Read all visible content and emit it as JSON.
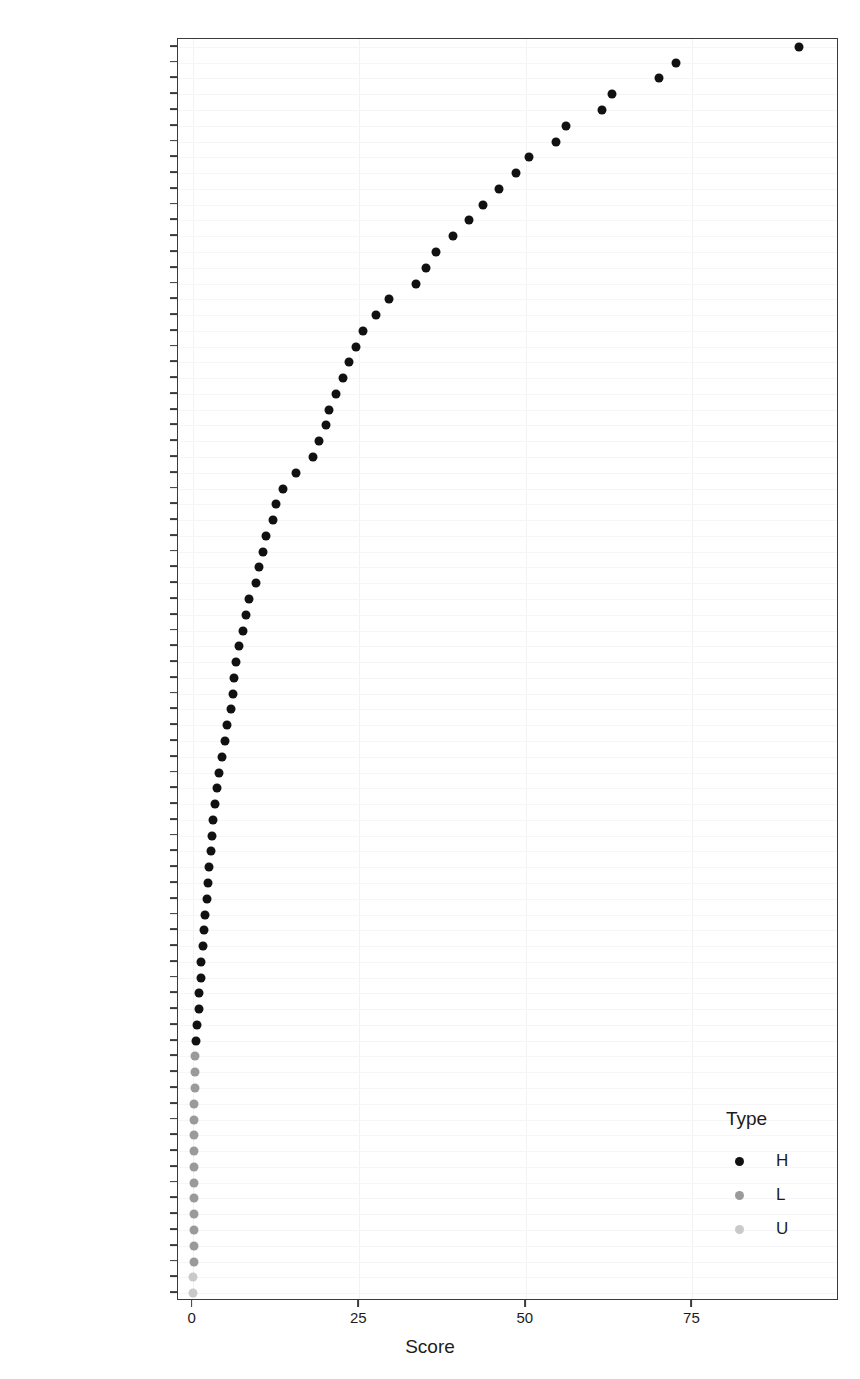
{
  "top_strip_text": "",
  "legend": {
    "title": "Type",
    "entries": [
      {
        "label": "H",
        "color": "#111111"
      },
      {
        "label": "L",
        "color": "#9a9a9a"
      },
      {
        "label": "U",
        "color": "#c9c9c9"
      }
    ]
  },
  "chart_data": {
    "type": "scatter",
    "title": "",
    "xlabel": "Score",
    "ylabel": "",
    "xlim": [
      -2.2,
      97.0
    ],
    "xticks": [
      0,
      25,
      50,
      75
    ],
    "xtick_labels": [
      "0",
      "25",
      "50",
      "75"
    ],
    "grid": true,
    "legend_position": "right-bottom",
    "legend_title": "Type",
    "groups": [
      "H",
      "L",
      "U"
    ],
    "group_colors": {
      "H": "#111111",
      "L": "#9a9a9a",
      "U": "#c9c9c9"
    },
    "categories": [
      "Overall_Qual",
      "Neighborhood",
      "Gr_Liv_Area",
      "Full_Bath",
      "Year_Built",
      "Exter_Qual",
      "Garage_Cars",
      "Kitchen_Qual",
      "Foundation",
      "Bsmt_Qual",
      "Garage_Finish",
      "MS_SubClass",
      "Garage_Area",
      "Year_Remod_Add",
      "Garage_Type",
      "Total_Bsmt_SF",
      "Fireplace_Qu",
      "Fireplaces",
      "BsmtFin_Type_1",
      "First_Flr_SF",
      "Open_Porch_SF",
      "Heating_QC",
      "Longitude",
      "Latitude",
      "TotRms_AbvGrd",
      "Exterior_1st",
      "Exterior_2nd",
      "Lot_Area",
      "Mas_Vnr_Type",
      "Mas_Vnr_Area",
      "MS_Zoning",
      "Overall_Cond",
      "Half_Bath",
      "House_Style",
      "Lot_Shape",
      "BsmtFin_SF_1",
      "Wood_Deck_SF",
      "Sale_Condition",
      "Lot_Frontage",
      "Bsmt_Exposure",
      "Sale_Type",
      "Garage_Qual",
      "Garage_Cond",
      "Central_Air",
      "Paved_Drive",
      "Electrical",
      "Bedroom_AbvGr",
      "Fence",
      "Bsmt_Full_Bath",
      "Condition_1",
      "Bsmt_Cond",
      "Enclosed_Porch",
      "Bldg_Type",
      "Second_Flr_SF",
      "Bsmt_Unf_SF",
      "Alley",
      "BsmtFin_Type_2",
      "Kitchen_AbvGr",
      "Land_Contour",
      "Lot_Config",
      "Exter_Cond",
      "Street",
      "Roof_Style",
      "Utilities",
      "Screen_Porch",
      "BsmtFin_SF_2",
      "Functional",
      "Heating",
      "Pool_Area",
      "Land_Slope",
      "Low_Qual_Fin_SF",
      "Pool_QC",
      "Condition_2",
      "Misc_Feature",
      "Misc_Val",
      "Bsmt_Half_Bath",
      "Roof_Matl",
      "Mo_Sold",
      "Three_season_porch",
      "Year_Sold"
    ],
    "values": [
      91.0,
      72.5,
      70.0,
      63.0,
      61.5,
      56.0,
      54.5,
      50.5,
      48.5,
      46.0,
      43.5,
      41.5,
      39.0,
      36.5,
      35.0,
      33.5,
      29.5,
      27.5,
      25.5,
      24.5,
      23.5,
      22.5,
      21.5,
      20.5,
      20.0,
      19.0,
      18.0,
      15.5,
      13.5,
      12.5,
      12.0,
      11.0,
      10.5,
      10.0,
      9.5,
      8.5,
      8.0,
      7.5,
      7.0,
      6.5,
      6.2,
      6.0,
      5.8,
      5.2,
      4.8,
      4.4,
      4.0,
      3.7,
      3.4,
      3.1,
      2.9,
      2.7,
      2.5,
      2.3,
      2.1,
      1.9,
      1.7,
      1.5,
      1.3,
      1.2,
      1.0,
      0.9,
      0.7,
      0.5,
      0.35,
      0.3,
      0.28,
      0.26,
      0.24,
      0.22,
      0.2,
      0.19,
      0.18,
      0.17,
      0.16,
      0.15,
      0.14,
      0.13,
      0.12,
      0.1
    ],
    "types": [
      "H",
      "H",
      "H",
      "H",
      "H",
      "H",
      "H",
      "H",
      "H",
      "H",
      "H",
      "H",
      "H",
      "H",
      "H",
      "H",
      "H",
      "H",
      "H",
      "H",
      "H",
      "H",
      "H",
      "H",
      "H",
      "H",
      "H",
      "H",
      "H",
      "H",
      "H",
      "H",
      "H",
      "H",
      "H",
      "H",
      "H",
      "H",
      "H",
      "H",
      "H",
      "H",
      "H",
      "H",
      "H",
      "H",
      "H",
      "H",
      "H",
      "H",
      "H",
      "H",
      "H",
      "H",
      "H",
      "H",
      "H",
      "H",
      "H",
      "H",
      "H",
      "H",
      "H",
      "H",
      "L",
      "L",
      "L",
      "L",
      "L",
      "L",
      "L",
      "L",
      "L",
      "L",
      "L",
      "L",
      "L",
      "L",
      "U",
      "U"
    ]
  }
}
